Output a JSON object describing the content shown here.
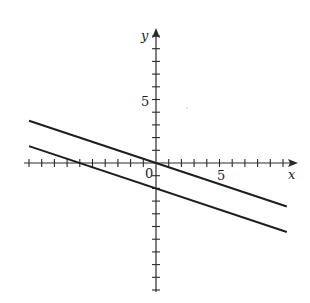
{
  "chart_data": {
    "type": "line",
    "title": "",
    "xlabel": "x",
    "ylabel": "y",
    "origin_label": "0",
    "x_tick_label": "5",
    "y_tick_label": "5",
    "xlim": [
      -10,
      11
    ],
    "ylim": [
      -10,
      10.5
    ],
    "tick_spacing": 1,
    "grid": false,
    "legend": null,
    "series": [
      {
        "name": "line-1",
        "equation": "y = -x/3",
        "x": [
          -10,
          10.3
        ],
        "y": [
          3.33,
          -3.43
        ]
      },
      {
        "name": "line-2",
        "equation": "y = -x/3 - 2",
        "x": [
          -10,
          10.3
        ],
        "y": [
          1.33,
          -5.43
        ]
      }
    ],
    "colors": {
      "axis": "#2a2a2a",
      "line": "#1e1e1e"
    }
  }
}
